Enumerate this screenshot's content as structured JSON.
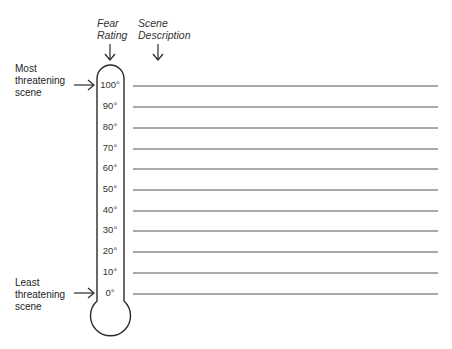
{
  "headers": {
    "fear_rating": [
      "Fear",
      "Rating"
    ],
    "scene_description": [
      "Scene",
      "Description"
    ]
  },
  "annotations": {
    "top": [
      "Most",
      "threatening",
      "scene"
    ],
    "bottom": [
      "Least",
      "threatening",
      "scene"
    ]
  },
  "scale": {
    "unit": "degrees",
    "ticks": [
      "100°",
      "90°",
      "80°",
      "70°",
      "60°",
      "50°",
      "40°",
      "30°",
      "20°",
      "10°",
      "0°"
    ]
  },
  "scene_lines": [
    "",
    "",
    "",
    "",
    "",
    "",
    "",
    "",
    "",
    "",
    ""
  ],
  "colors": {
    "ink": "#2a2a2a",
    "line": "#555555",
    "background": "#ffffff"
  }
}
